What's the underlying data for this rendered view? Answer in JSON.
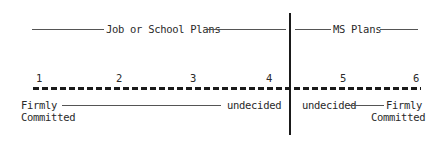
{
  "header": {
    "left_section": "Job or School Plans",
    "right_section": "MS Plans"
  },
  "scale": {
    "points": [
      "1",
      "2",
      "3",
      "4",
      "5",
      "6"
    ]
  },
  "labels": {
    "left_start": {
      "line1": "Firmly",
      "line2": "Committed"
    },
    "left_end": "undecided",
    "right_start": "undecided",
    "right_end": {
      "line1": "Firmly",
      "line2": "Committed"
    }
  },
  "colors": {
    "ink": "#1a1a1a",
    "background": "#ffffff"
  }
}
